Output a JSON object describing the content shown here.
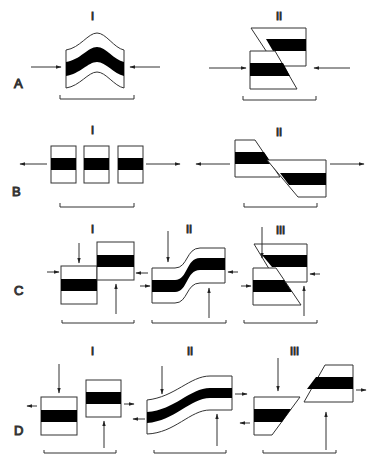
{
  "figure": {
    "rows": [
      {
        "label": "A",
        "panels": [
          {
            "numeral": "I",
            "style": "compressional fold"
          },
          {
            "numeral": "II",
            "style": "reverse fault"
          }
        ]
      },
      {
        "label": "B",
        "panels": [
          {
            "numeral": "I",
            "style": "boudinage / extension blocks"
          },
          {
            "numeral": "II",
            "style": "normal fault"
          }
        ]
      },
      {
        "label": "C",
        "panels": [
          {
            "numeral": "I",
            "style": "vertical offset blocks"
          },
          {
            "numeral": "II",
            "style": "monocline flexure"
          },
          {
            "numeral": "III",
            "style": "faulted offset"
          }
        ]
      },
      {
        "label": "D",
        "panels": [
          {
            "numeral": "I",
            "style": "separated offset blocks"
          },
          {
            "numeral": "II",
            "style": "extended flexure"
          },
          {
            "numeral": "III",
            "style": "extensional faulted offset"
          }
        ]
      }
    ],
    "colors": {
      "line": "#333333",
      "fill_band": "#000000",
      "background": "#ffffff",
      "text": "#555555"
    }
  }
}
